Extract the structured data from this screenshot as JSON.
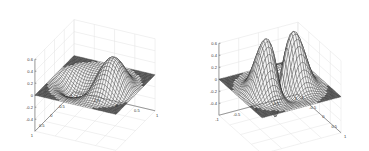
{
  "chart_data": [
    {
      "type": "surface",
      "title": "",
      "xlabel": "",
      "ylabel": "",
      "zlabel": "",
      "z_ticks": [
        "0.6",
        "0.4",
        "0.2",
        "0",
        "-0.2",
        "-0.4"
      ],
      "x_ticks": [
        "1",
        "0.5",
        "0",
        "-0.5",
        "-1"
      ],
      "y_ticks": [
        "-1",
        "-0.5",
        "0",
        "0.5",
        "1"
      ],
      "xlim": [
        -1,
        1
      ],
      "ylim": [
        -1,
        1
      ],
      "zlim": [
        -0.6,
        0.6
      ],
      "grid": true,
      "style": "wireframe mesh, black lines, flat region dark grey",
      "description": "Single large positive lobe peaking ~0.6 with a negative trough ~-0.5 in front; flat zero plane outside unit disk"
    },
    {
      "type": "surface",
      "title": "",
      "xlabel": "",
      "ylabel": "",
      "zlabel": "",
      "z_ticks": [
        "0.6",
        "0.4",
        "0.2",
        "0",
        "-0.2",
        "-0.4"
      ],
      "x_ticks": [
        "-1",
        "-0.5",
        "0",
        "0.5",
        "1"
      ],
      "y_ticks": [
        "-1",
        "-0.5",
        "0",
        "0.5",
        "1"
      ],
      "xlim": [
        -1,
        1
      ],
      "ylim": [
        -1,
        1
      ],
      "zlim": [
        -0.6,
        0.6
      ],
      "grid": true,
      "style": "wireframe mesh, black lines, flat region dark grey",
      "description": "Multiple lobes (ring-like with central dip) peaking ~0.6, negative trough ~-0.5 in front right; flat zero plane outside unit disk"
    }
  ]
}
